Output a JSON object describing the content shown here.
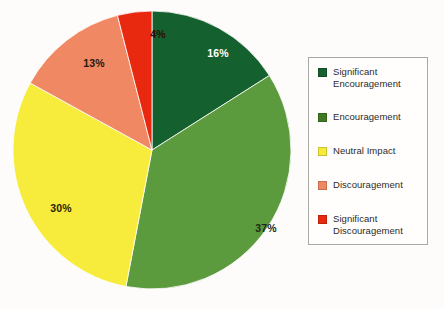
{
  "chart_data": {
    "type": "pie",
    "title": "",
    "subtitle": "",
    "xlabel": "",
    "ylabel": "",
    "legend_position": "right",
    "grid": false,
    "start_angle_deg": 0,
    "direction": "clockwise",
    "categories": [
      "Significant Encouragement",
      "Encouragement",
      "Neutral Impact",
      "Discouragement",
      "Significant Discouragement"
    ],
    "values": [
      16,
      37,
      30,
      13,
      4
    ],
    "value_labels": [
      "16%",
      "37%",
      "30%",
      "13%",
      "4%"
    ],
    "colors": [
      "#15602f",
      "#5b9a3d",
      "#f7ec3c",
      "#f08864",
      "#e8290f"
    ],
    "label_colors": [
      "#ffffff",
      "#1e2b16",
      "#241f05",
      "#2b1708",
      "#2a0d05"
    ],
    "units": "percent",
    "total": 100
  },
  "pie": {
    "slices": [
      {
        "name": "Significant Encouragement",
        "percent_label": "16%",
        "value": 16,
        "color": "#15602f",
        "label_color": "#ffffff",
        "label_x": 205,
        "label_y": 47
      },
      {
        "name": "Encouragement",
        "percent_label": "37%",
        "value": 37,
        "color": "#5b9a3d",
        "label_x": 253,
        "label_y": 222,
        "label_color": "#1e2b16"
      },
      {
        "name": "Neutral Impact",
        "percent_label": "30%",
        "value": 30,
        "color": "#f7ec3c",
        "label_x": 48,
        "label_y": 202,
        "label_color": "#241f05"
      },
      {
        "name": "Discouragement",
        "percent_label": "13%",
        "value": 13,
        "color": "#f08864",
        "label_x": 81,
        "label_y": 57,
        "label_color": "#2b1708"
      },
      {
        "name": "Significant Discouragement",
        "percent_label": "4%",
        "value": 4,
        "color": "#e8290f",
        "label_x": 145,
        "label_y": 28,
        "label_color": "#2a0d05"
      }
    ]
  },
  "legend": {
    "items": [
      {
        "label": "Significant\nEncouragement",
        "color": "#15602f",
        "icon": "legend-swatch-icon"
      },
      {
        "label": "Encouragement",
        "color": "#3f7a23",
        "icon": "legend-swatch-icon"
      },
      {
        "label": "Neutral Impact",
        "color": "#f7ec3c",
        "icon": "legend-swatch-icon"
      },
      {
        "label": "Discouragement",
        "color": "#f08864",
        "icon": "legend-swatch-icon"
      },
      {
        "label": "Significant\nDiscouragement",
        "color": "#e8290f",
        "icon": "legend-swatch-icon"
      }
    ]
  },
  "canvas": {
    "background": "#fdfcfa",
    "legend_border": "#a9a9a4"
  }
}
